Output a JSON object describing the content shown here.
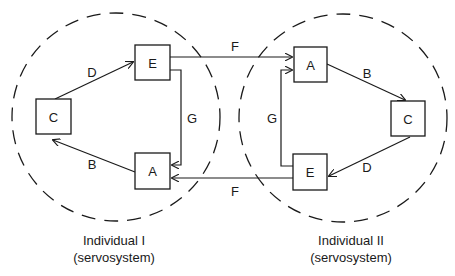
{
  "diagram": {
    "type": "coupled servosystems",
    "individuals": [
      {
        "caption_line1": "Individual I",
        "caption_line2": "(servosystem)",
        "nodes": {
          "C": "C",
          "E": "E",
          "A": "A"
        },
        "edges": [
          {
            "from": "A",
            "to": "C",
            "label": "B"
          },
          {
            "from": "C",
            "to": "E",
            "label": "D"
          },
          {
            "from": "E",
            "to": "A",
            "label": "G"
          }
        ]
      },
      {
        "caption_line1": "Individual II",
        "caption_line2": "(servosystem)",
        "nodes": {
          "A": "A",
          "C": "C",
          "E": "E"
        },
        "edges": [
          {
            "from": "A",
            "to": "C",
            "label": "B"
          },
          {
            "from": "C",
            "to": "E",
            "label": "D"
          },
          {
            "from": "E",
            "to": "A",
            "label": "G"
          }
        ]
      }
    ],
    "cross_edges": [
      {
        "from": "Individual I E",
        "to": "Individual II A",
        "label": "F"
      },
      {
        "from": "Individual II E",
        "to": "Individual I A",
        "label": "F"
      }
    ]
  }
}
